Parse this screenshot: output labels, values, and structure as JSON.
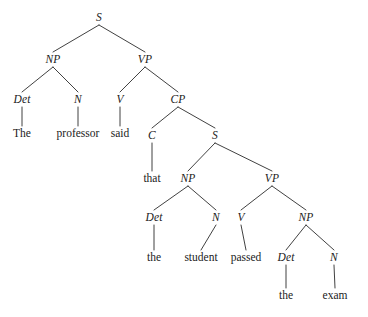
{
  "figure": {
    "kind": "constituency-parse-tree",
    "sentence": "The professor said that the student passed the exam",
    "width": 368,
    "height": 317,
    "background_color": "#ffffff",
    "line_color": "#2b2b2b",
    "text_color": "#1b1b1b"
  },
  "nodes": [
    {
      "id": "s-root",
      "label": "S",
      "kind": "category",
      "x": 99,
      "y": 18
    },
    {
      "id": "np-1",
      "label": "NP",
      "kind": "category",
      "x": 53,
      "y": 60
    },
    {
      "id": "vp-1",
      "label": "VP",
      "kind": "category",
      "x": 145,
      "y": 60
    },
    {
      "id": "det-1",
      "label": "Det",
      "kind": "category",
      "x": 22,
      "y": 100
    },
    {
      "id": "n-1",
      "label": "N",
      "kind": "category",
      "x": 78,
      "y": 100
    },
    {
      "id": "v-1",
      "label": "V",
      "kind": "category",
      "x": 120,
      "y": 100
    },
    {
      "id": "cp-1",
      "label": "CP",
      "kind": "category",
      "x": 178,
      "y": 100
    },
    {
      "id": "word-the-1",
      "label": "The",
      "kind": "word",
      "x": 22,
      "y": 134
    },
    {
      "id": "word-prof",
      "label": "professor",
      "kind": "word",
      "x": 78,
      "y": 134
    },
    {
      "id": "word-said",
      "label": "said",
      "kind": "word",
      "x": 120,
      "y": 134
    },
    {
      "id": "c-1",
      "label": "C",
      "kind": "category",
      "x": 152,
      "y": 136
    },
    {
      "id": "s-embed",
      "label": "S",
      "kind": "category",
      "x": 215,
      "y": 136
    },
    {
      "id": "word-that",
      "label": "that",
      "kind": "word",
      "x": 152,
      "y": 179
    },
    {
      "id": "np-2",
      "label": "NP",
      "kind": "category",
      "x": 188,
      "y": 179
    },
    {
      "id": "vp-2",
      "label": "VP",
      "kind": "category",
      "x": 272,
      "y": 179
    },
    {
      "id": "det-2",
      "label": "Det",
      "kind": "category",
      "x": 154,
      "y": 218
    },
    {
      "id": "n-2",
      "label": "N",
      "kind": "category",
      "x": 216,
      "y": 218
    },
    {
      "id": "v-2",
      "label": "V",
      "kind": "category",
      "x": 241,
      "y": 218
    },
    {
      "id": "np-3",
      "label": "NP",
      "kind": "category",
      "x": 306,
      "y": 218
    },
    {
      "id": "word-the-2",
      "label": "the",
      "kind": "word",
      "x": 154,
      "y": 258
    },
    {
      "id": "word-student",
      "label": "student",
      "kind": "word",
      "x": 201,
      "y": 258
    },
    {
      "id": "word-passed",
      "label": "passed",
      "kind": "word",
      "x": 246,
      "y": 258
    },
    {
      "id": "det-3",
      "label": "Det",
      "kind": "category",
      "x": 286,
      "y": 258
    },
    {
      "id": "n-3",
      "label": "N",
      "kind": "category",
      "x": 334,
      "y": 258
    },
    {
      "id": "word-the-3",
      "label": "the",
      "kind": "word",
      "x": 286,
      "y": 296
    },
    {
      "id": "word-exam",
      "label": "exam",
      "kind": "word",
      "x": 335,
      "y": 296
    }
  ],
  "edges": [
    {
      "from": "s-root",
      "to": "np-1"
    },
    {
      "from": "s-root",
      "to": "vp-1"
    },
    {
      "from": "np-1",
      "to": "det-1"
    },
    {
      "from": "np-1",
      "to": "n-1"
    },
    {
      "from": "vp-1",
      "to": "v-1"
    },
    {
      "from": "vp-1",
      "to": "cp-1"
    },
    {
      "from": "det-1",
      "to": "word-the-1"
    },
    {
      "from": "n-1",
      "to": "word-prof"
    },
    {
      "from": "v-1",
      "to": "word-said"
    },
    {
      "from": "cp-1",
      "to": "c-1"
    },
    {
      "from": "cp-1",
      "to": "s-embed"
    },
    {
      "from": "c-1",
      "to": "word-that"
    },
    {
      "from": "s-embed",
      "to": "np-2"
    },
    {
      "from": "s-embed",
      "to": "vp-2"
    },
    {
      "from": "np-2",
      "to": "det-2"
    },
    {
      "from": "np-2",
      "to": "n-2"
    },
    {
      "from": "vp-2",
      "to": "v-2"
    },
    {
      "from": "vp-2",
      "to": "np-3"
    },
    {
      "from": "det-2",
      "to": "word-the-2"
    },
    {
      "from": "n-2",
      "to": "word-student"
    },
    {
      "from": "v-2",
      "to": "word-passed"
    },
    {
      "from": "np-3",
      "to": "det-3"
    },
    {
      "from": "np-3",
      "to": "n-3"
    },
    {
      "from": "det-3",
      "to": "word-the-3"
    },
    {
      "from": "n-3",
      "to": "word-exam"
    }
  ]
}
